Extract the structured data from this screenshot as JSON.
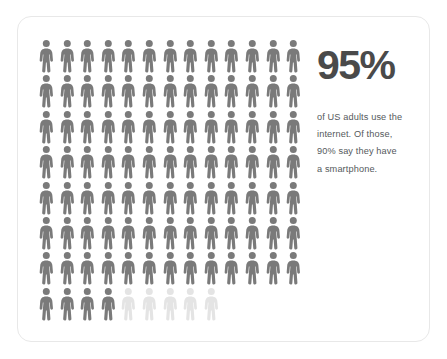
{
  "card": {
    "background_color": "#ffffff",
    "border_color": "#e8e8e8"
  },
  "headline": {
    "value": "95%",
    "color": "#4a4a4a"
  },
  "description": {
    "lines": [
      "of US adults use the",
      "internet. Of those,",
      "90% say they have",
      "a smartphone."
    ],
    "color": "#55595c"
  },
  "chart_data": {
    "type": "pictogram",
    "title": "95%",
    "subtitle": "of US adults use the internet. Of those, 90% say they have a smartphone.",
    "icon": "person-icon",
    "unit_value": 1,
    "unit_label": "1 figure = 1 percent",
    "total_units": 100,
    "columns": 13,
    "rows": 8,
    "categories": [
      "US adults who use the internet",
      "US adults who do not use the internet"
    ],
    "values": [
      95,
      5
    ],
    "colors": [
      "#7a7a7a",
      "#e4e4e4"
    ],
    "filled_count": 95,
    "empty_count": 5,
    "row_counts": [
      13,
      13,
      13,
      13,
      13,
      13,
      13,
      9
    ],
    "last_row_filled": 4,
    "last_row_empty": 5,
    "xlabel": "",
    "ylabel": "",
    "grid": false,
    "legend": false
  }
}
